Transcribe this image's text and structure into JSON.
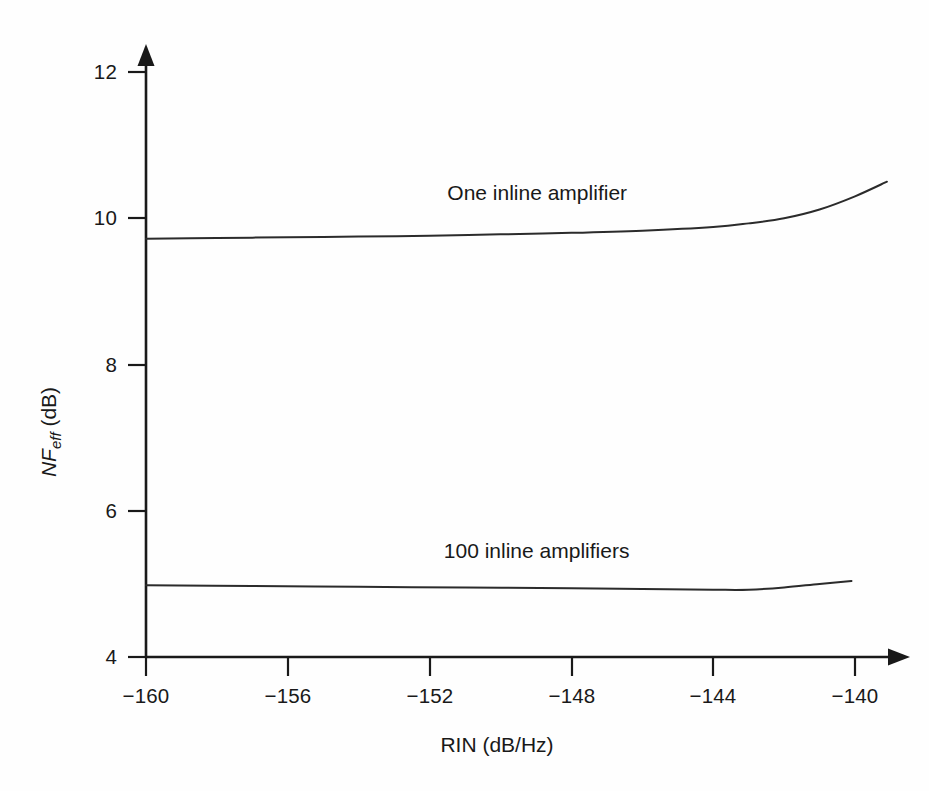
{
  "chart_data": {
    "type": "line",
    "title": "",
    "xlabel": "RIN (dB/Hz)",
    "ylabel": "NF_eff (dB)",
    "ylabel_parts": {
      "main": "NF",
      "subscript": "eff",
      "units": " (dB)"
    },
    "xlim": [
      -160,
      -139
    ],
    "ylim": [
      4,
      12
    ],
    "xticks": [
      -160,
      -156,
      -152,
      -148,
      -144,
      -140
    ],
    "xtick_labels": [
      "−160",
      "−156",
      "−152",
      "−148",
      "−144",
      "−140"
    ],
    "yticks": [
      4,
      6,
      8,
      10,
      12
    ],
    "ytick_labels": [
      "4",
      "6",
      "8",
      "10",
      "12"
    ],
    "grid": false,
    "legend_position": "inline-annotations",
    "axis_style": "arrow-terminated L-axes",
    "series": [
      {
        "name": "One inline amplifier",
        "label_x": -151.5,
        "label_y": 10.25,
        "x": [
          -160,
          -158,
          -156,
          -154,
          -152,
          -150,
          -148,
          -146,
          -144,
          -143,
          -142,
          -141,
          -140,
          -139.1
        ],
        "values": [
          9.72,
          9.73,
          9.74,
          9.75,
          9.76,
          9.78,
          9.8,
          9.83,
          9.88,
          9.93,
          10.0,
          10.12,
          10.3,
          10.5
        ]
      },
      {
        "name": "100 inline amplifiers",
        "label_x": -151.6,
        "label_y": 5.35,
        "x": [
          -160,
          -157,
          -154,
          -151,
          -148,
          -146,
          -144,
          -143,
          -142,
          -141,
          -140.1
        ],
        "values": [
          4.98,
          4.97,
          4.96,
          4.95,
          4.94,
          4.93,
          4.92,
          4.92,
          4.95,
          5.0,
          5.04
        ]
      }
    ]
  },
  "annotations": {
    "series_one_label": "One inline amplifier",
    "series_hundred_label": "100 inline amplifiers"
  }
}
